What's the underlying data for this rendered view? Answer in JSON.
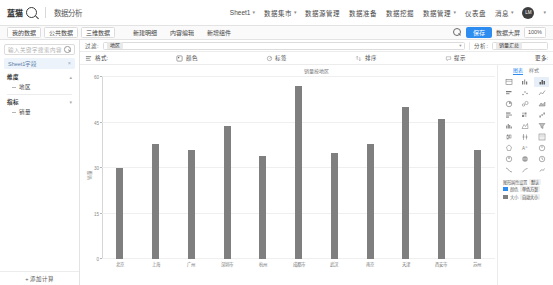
{
  "app": {
    "brand_name": "蓝猫",
    "brand_sub": "数据分析",
    "avatar_initials": "LM"
  },
  "topbar": {
    "items": [
      {
        "label": "Sheet1",
        "caret": "▾"
      },
      {
        "label": "数据集市",
        "caret": "▾"
      },
      {
        "label": "数据源管理",
        "caret": ""
      },
      {
        "label": "数据准备",
        "caret": ""
      },
      {
        "label": "数据挖掘",
        "caret": ""
      },
      {
        "label": "数据模型",
        "caret": ""
      },
      {
        "label": "数据管理",
        "caret": "▾"
      },
      {
        "label": "仪表盘",
        "caret": ""
      },
      {
        "label": "消息",
        "caret": "▾"
      }
    ]
  },
  "menubar": {
    "groups": [
      {
        "buttons": [
          "我的数据",
          "公共数据",
          "三维数据"
        ]
      },
      {
        "buttons": [
          "新建明细",
          "内容编辑",
          "新增组件"
        ]
      }
    ],
    "search_icon": "search-icon",
    "primary_button": "保存",
    "text": "数据大屏",
    "badge": "100%"
  },
  "sidebar": {
    "search_placeholder": "输入关键字搜索内容",
    "search_value": "",
    "panel_title": "Sheet1字段",
    "close_label": "×",
    "tree": [
      {
        "label": "维度",
        "caret": "▴",
        "children": [
          "地区"
        ]
      },
      {
        "label": "指标",
        "caret": "▾",
        "children": [
          "销量"
        ]
      }
    ],
    "footer_button": "+ 添加计算"
  },
  "filterbar": {
    "label_left": "过滤:",
    "value_left": "地区",
    "caret": "▾",
    "label_right": "分析:",
    "value_right": "销量汇总"
  },
  "toolbar2": {
    "items": [
      {
        "label": "格式:",
        "icon": "format-icon"
      },
      {
        "label": "颜色",
        "icon": "palette-icon"
      },
      {
        "label": "标签",
        "icon": "tag-icon"
      },
      {
        "label": "排序",
        "icon": "sort-icon"
      },
      {
        "label": "提示",
        "icon": "tooltip-icon"
      },
      {
        "label": "更多:",
        "icon": "more-icon"
      }
    ]
  },
  "right_panel": {
    "tabs": [
      {
        "label": "图表",
        "active": true
      },
      {
        "label": "样式",
        "active": false
      }
    ],
    "icons": [
      "table-chart-icon",
      "grouped-bar-icon",
      "column-chart-icon",
      "stacked-bar-icon",
      "scatter-chart-icon",
      "line-chart-icon",
      "pie-chart-icon",
      "bubble-chart-icon",
      "area-chart-icon",
      "hbar-chart-icon",
      "heatmap-icon",
      "waterfall-icon",
      "histogram-icon",
      "mountain-chart-icon",
      "funnel-icon",
      "boxplot-icon",
      "candlestick-icon",
      "matrix-icon",
      "radar-icon",
      "wordcloud-icon",
      "gauge-icon",
      "map-point-icon",
      "map-area-icon",
      "clock-icon",
      "sankey-icon",
      "tree-icon",
      "chord-icon"
    ],
    "selected_index": 2,
    "footer": [
      {
        "label": "图形属性设置",
        "chip": "默认"
      },
      {
        "label": "颜色",
        "chip": "单色方案",
        "swatch": "blue"
      },
      {
        "label": "大小",
        "chip": "自动大小",
        "swatch": "grey"
      }
    ]
  },
  "chart_data": {
    "type": "bar",
    "title": "销量按地区",
    "xlabel": "",
    "ylabel": "销量",
    "ylim": [
      0,
      60
    ],
    "yticks": [
      0,
      15,
      30,
      45,
      60
    ],
    "bar_color": "#7f7f7f",
    "grid": true,
    "legend": "none",
    "categories": [
      "北京",
      "上海",
      "广州",
      "深圳市",
      "杭州",
      "成都市",
      "武汉",
      "南京",
      "天津",
      "西安市",
      "苏州"
    ],
    "values": [
      30,
      38,
      36,
      44,
      34,
      57,
      35,
      38,
      50,
      46,
      36
    ]
  }
}
